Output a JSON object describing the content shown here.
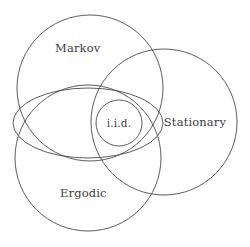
{
  "diagram": {
    "background_color": "#ffffff",
    "stroke_color": "#4a4a52",
    "text_color": "#3c3c44",
    "width": 250,
    "height": 247,
    "shapes": [
      {
        "id": "markov-circle",
        "kind": "circle",
        "label": "Markov",
        "cx": 90,
        "cy": 88,
        "r": 73,
        "label_x": 55,
        "label_y": 52
      },
      {
        "id": "stationary-circle",
        "kind": "circle",
        "label": "Stationary",
        "cx": 164,
        "cy": 122,
        "r": 73,
        "label_x": 195,
        "label_y": 126
      },
      {
        "id": "ergodic-circle",
        "kind": "circle",
        "label": "Ergodic",
        "cx": 88,
        "cy": 158,
        "r": 73,
        "label_x": 60,
        "label_y": 197
      },
      {
        "id": "intersection-ellipse",
        "kind": "ellipse",
        "label": "",
        "cx": 88,
        "cy": 123,
        "rx": 75,
        "ry": 35,
        "label_x": 0,
        "label_y": 0
      },
      {
        "id": "iid-circle",
        "kind": "circle",
        "label": "i.i.d.",
        "cx": 119,
        "cy": 123,
        "r": 23,
        "label_x": 119,
        "label_y": 127
      }
    ],
    "labels": {
      "markov": "Markov",
      "stationary": "Stationary",
      "ergodic": "Ergodic",
      "iid": "i.i.d."
    }
  }
}
